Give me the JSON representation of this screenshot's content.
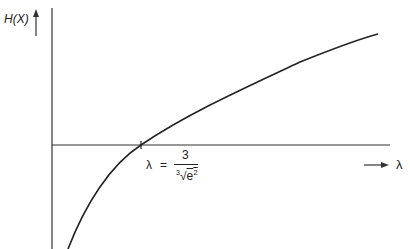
{
  "figure": {
    "y_axis_label": "H(X)",
    "x_axis_label": "λ",
    "annotation": {
      "lhs": "λ",
      "equals": "=",
      "numerator": "3",
      "root_index": "3",
      "radicand_base": "e",
      "radicand_exp": "2"
    },
    "curve_description": "Concave increasing curve crossing horizontal axis at λ = 3/∛(e²)",
    "colors": {
      "line": "#222222",
      "background": "#ffffff"
    }
  }
}
